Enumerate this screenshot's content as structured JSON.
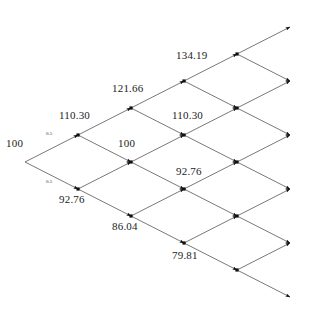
{
  "figure": {
    "type": "binomial-lattice-diagram",
    "title": "",
    "background_color": "#ffffff",
    "line_color": "#3d3d3d",
    "node_color": "#111111",
    "text_color": "#1c1c1c"
  },
  "chart_data": {
    "type": "diagram",
    "subtype": "binomial-tree-lattice",
    "title": "",
    "xlabel": "",
    "ylabel": "",
    "grid": false,
    "legend": null,
    "steps": 6,
    "up_factor": 1.103,
    "down_factor": 0.9276,
    "branch_probability": "0.5",
    "root_value": "100",
    "nodes": [
      {
        "id": "n0-0",
        "step": 0,
        "level": 0,
        "label": "100",
        "x": 25,
        "y": 162,
        "label_x": 6,
        "label_y": 138,
        "show_dot": false
      },
      {
        "id": "n1-0",
        "step": 1,
        "level": 1,
        "label": "110.30",
        "x": 78,
        "y": 135,
        "label_x": 59,
        "label_y": 110,
        "show_dot": true
      },
      {
        "id": "n1-1",
        "step": 1,
        "level": -1,
        "label": "92.76",
        "x": 78,
        "y": 189,
        "label_x": 59,
        "label_y": 194,
        "show_dot": true
      },
      {
        "id": "n2-0",
        "step": 2,
        "level": 2,
        "label": "121.66",
        "x": 131,
        "y": 108,
        "label_x": 112,
        "label_y": 83,
        "show_dot": true
      },
      {
        "id": "n2-1",
        "step": 2,
        "level": 0,
        "label": "100",
        "x": 131,
        "y": 162,
        "label_x": 118,
        "label_y": 138,
        "show_dot": true
      },
      {
        "id": "n2-2",
        "step": 2,
        "level": -2,
        "label": "86.04",
        "x": 131,
        "y": 216,
        "label_x": 112,
        "label_y": 221,
        "show_dot": true
      },
      {
        "id": "n3-0",
        "step": 3,
        "level": 3,
        "label": "134.19",
        "x": 184,
        "y": 81,
        "label_x": 176,
        "label_y": 50,
        "show_dot": true
      },
      {
        "id": "n3-1",
        "step": 3,
        "level": 1,
        "label": "110.30",
        "x": 184,
        "y": 135,
        "label_x": 172,
        "label_y": 110,
        "show_dot": true
      },
      {
        "id": "n3-2",
        "step": 3,
        "level": -1,
        "label": "92.76",
        "x": 184,
        "y": 189,
        "label_x": 176,
        "label_y": 166,
        "show_dot": true
      },
      {
        "id": "n3-3",
        "step": 3,
        "level": -3,
        "label": "79.81",
        "x": 184,
        "y": 243,
        "label_x": 172,
        "label_y": 250,
        "show_dot": true
      },
      {
        "id": "n4-0",
        "step": 4,
        "level": 4,
        "label": "",
        "x": 237,
        "y": 54,
        "label_x": 0,
        "label_y": 0,
        "show_dot": true
      },
      {
        "id": "n4-1",
        "step": 4,
        "level": 2,
        "label": "",
        "x": 237,
        "y": 108,
        "label_x": 0,
        "label_y": 0,
        "show_dot": true
      },
      {
        "id": "n4-2",
        "step": 4,
        "level": 0,
        "label": "",
        "x": 237,
        "y": 162,
        "label_x": 0,
        "label_y": 0,
        "show_dot": true
      },
      {
        "id": "n4-3",
        "step": 4,
        "level": -2,
        "label": "",
        "x": 237,
        "y": 216,
        "label_x": 0,
        "label_y": 0,
        "show_dot": true
      },
      {
        "id": "n4-4",
        "step": 4,
        "level": -4,
        "label": "",
        "x": 237,
        "y": 270,
        "label_x": 0,
        "label_y": 0,
        "show_dot": true
      },
      {
        "id": "n5-0",
        "step": 5,
        "level": 5,
        "label": "",
        "x": 290,
        "y": 27,
        "label_x": 0,
        "label_y": 0,
        "show_dot": false
      },
      {
        "id": "n5-1",
        "step": 5,
        "level": 3,
        "label": "",
        "x": 290,
        "y": 81,
        "label_x": 0,
        "label_y": 0,
        "show_dot": false
      },
      {
        "id": "n5-2",
        "step": 5,
        "level": 1,
        "label": "",
        "x": 290,
        "y": 135,
        "label_x": 0,
        "label_y": 0,
        "show_dot": false
      },
      {
        "id": "n5-3",
        "step": 5,
        "level": -1,
        "label": "",
        "x": 290,
        "y": 189,
        "label_x": 0,
        "label_y": 0,
        "show_dot": false
      },
      {
        "id": "n5-4",
        "step": 5,
        "level": -3,
        "label": "",
        "x": 290,
        "y": 243,
        "label_x": 0,
        "label_y": 0,
        "show_dot": false
      },
      {
        "id": "n5-5",
        "step": 5,
        "level": -5,
        "label": "",
        "x": 290,
        "y": 297,
        "label_x": 0,
        "label_y": 0,
        "show_dot": false
      }
    ],
    "value_labels": [
      {
        "text": "100",
        "x": 6,
        "y": 138
      },
      {
        "text": "110.30",
        "x": 59,
        "y": 110
      },
      {
        "text": "92.76",
        "x": 59,
        "y": 194
      },
      {
        "text": "121.66",
        "x": 112,
        "y": 83
      },
      {
        "text": "100",
        "x": 118,
        "y": 138
      },
      {
        "text": "86.04",
        "x": 112,
        "y": 221
      },
      {
        "text": "134.19",
        "x": 176,
        "y": 50
      },
      {
        "text": "110.30",
        "x": 172,
        "y": 110
      },
      {
        "text": "92.76",
        "x": 176,
        "y": 166
      },
      {
        "text": "79.81",
        "x": 172,
        "y": 250
      }
    ],
    "probability_labels": [
      {
        "text": "0.5",
        "x": 46,
        "y": 131
      },
      {
        "text": "0.5",
        "x": 46,
        "y": 179
      }
    ],
    "edges": [
      {
        "from": "n0-0",
        "to": "n1-0",
        "arrow": true
      },
      {
        "from": "n0-0",
        "to": "n1-1",
        "arrow": true
      },
      {
        "from": "n1-0",
        "to": "n2-0",
        "arrow": true
      },
      {
        "from": "n1-0",
        "to": "n2-1",
        "arrow": true
      },
      {
        "from": "n1-1",
        "to": "n2-1",
        "arrow": true
      },
      {
        "from": "n1-1",
        "to": "n2-2",
        "arrow": true
      },
      {
        "from": "n2-0",
        "to": "n3-0",
        "arrow": true
      },
      {
        "from": "n2-0",
        "to": "n3-1",
        "arrow": true
      },
      {
        "from": "n2-1",
        "to": "n3-1",
        "arrow": true
      },
      {
        "from": "n2-1",
        "to": "n3-2",
        "arrow": true
      },
      {
        "from": "n2-2",
        "to": "n3-2",
        "arrow": true
      },
      {
        "from": "n2-2",
        "to": "n3-3",
        "arrow": true
      },
      {
        "from": "n3-0",
        "to": "n4-0",
        "arrow": true
      },
      {
        "from": "n3-0",
        "to": "n4-1",
        "arrow": true
      },
      {
        "from": "n3-1",
        "to": "n4-1",
        "arrow": true
      },
      {
        "from": "n3-1",
        "to": "n4-2",
        "arrow": true
      },
      {
        "from": "n3-2",
        "to": "n4-2",
        "arrow": true
      },
      {
        "from": "n3-2",
        "to": "n4-3",
        "arrow": true
      },
      {
        "from": "n3-3",
        "to": "n4-3",
        "arrow": true
      },
      {
        "from": "n3-3",
        "to": "n4-4",
        "arrow": true
      },
      {
        "from": "n4-0",
        "to": "n5-0",
        "arrow": true
      },
      {
        "from": "n4-0",
        "to": "n5-1",
        "arrow": true
      },
      {
        "from": "n4-1",
        "to": "n5-1",
        "arrow": true
      },
      {
        "from": "n4-1",
        "to": "n5-2",
        "arrow": true
      },
      {
        "from": "n4-2",
        "to": "n5-2",
        "arrow": true
      },
      {
        "from": "n4-2",
        "to": "n5-3",
        "arrow": true
      },
      {
        "from": "n4-3",
        "to": "n5-3",
        "arrow": true
      },
      {
        "from": "n4-3",
        "to": "n5-4",
        "arrow": true
      },
      {
        "from": "n4-4",
        "to": "n5-4",
        "arrow": true
      },
      {
        "from": "n4-4",
        "to": "n5-5",
        "arrow": true
      }
    ]
  }
}
